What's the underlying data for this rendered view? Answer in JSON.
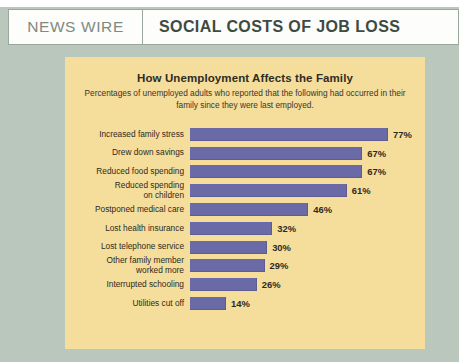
{
  "header": {
    "kicker": "NEWS WIRE",
    "title": "SOCIAL COSTS OF JOB LOSS"
  },
  "colors": {
    "background": "#b9c7bd",
    "panel": "#f5dd9b",
    "bar": "#6a6aa6",
    "header_background": "#fdfdfb",
    "header_border": "#9aa79c",
    "title_text": "#3f4a42",
    "kicker_text": "#7d8a80"
  },
  "chart_data": {
    "type": "bar",
    "orientation": "horizontal",
    "title": "How Unemployment Affects the Family",
    "subtitle": "Percentages of unemployed adults who reported that the following had occurred in their family since they were last employed.",
    "xlabel": "",
    "ylabel": "",
    "xlim": [
      0,
      100
    ],
    "grid": false,
    "legend": "none",
    "value_suffix": "%",
    "categories": [
      "Increased family stress",
      "Drew down savings",
      "Reduced food spending",
      "Reduced spending\non children",
      "Postponed medical care",
      "Lost health insurance",
      "Lost telephone service",
      "Other family member\nworked more",
      "Interrupted schooling",
      "Utilities cut off"
    ],
    "values": [
      77,
      67,
      67,
      61,
      46,
      32,
      30,
      29,
      26,
      14
    ],
    "value_labels": [
      "77%",
      "67%",
      "67%",
      "61%",
      "46%",
      "32%",
      "30%",
      "29%",
      "26%",
      "14%"
    ]
  },
  "credit": {
    "text": ""
  }
}
